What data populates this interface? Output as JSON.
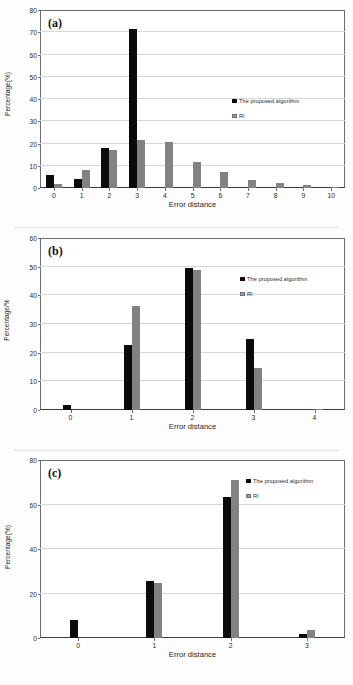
{
  "figure": {
    "panels": [
      "a",
      "b",
      "c"
    ]
  },
  "chart_data": [
    {
      "type": "bar",
      "panel_label": "(a)",
      "title": "",
      "xlabel": "Error distance",
      "ylabel": "Percentage(%)",
      "categories": [
        "0",
        "1",
        "2",
        "3",
        "4",
        "5",
        "6",
        "7",
        "8",
        "9",
        "10"
      ],
      "ylim": [
        0,
        80
      ],
      "yticks": [
        0,
        10,
        20,
        30,
        40,
        50,
        60,
        70,
        80
      ],
      "grid": true,
      "legend_position": "right-inside",
      "series": [
        {
          "name": "The proposed algorithm",
          "color": "#0b0b0b",
          "values": [
            6.0,
            4.0,
            18.0,
            71.6,
            0,
            0,
            0,
            0,
            0,
            0,
            0
          ]
        },
        {
          "name": "RI",
          "color": "#828282",
          "values": [
            1.8,
            8.0,
            16.9,
            21.7,
            20.8,
            11.5,
            7.4,
            3.6,
            2.3,
            1.3,
            0.5
          ]
        }
      ]
    },
    {
      "type": "bar",
      "panel_label": "(b)",
      "title": "",
      "xlabel": "Error distance",
      "ylabel": "Percentage/%",
      "categories": [
        "0",
        "1",
        "2",
        "3",
        "4"
      ],
      "ylim": [
        0,
        60
      ],
      "yticks": [
        0,
        10,
        20,
        30,
        40,
        50,
        60
      ],
      "grid": true,
      "legend_position": "right-inside",
      "series": [
        {
          "name": "The proposed algorithm",
          "color": "#0b0b0b",
          "values": [
            1.9,
            22.7,
            49.7,
            24.6,
            0
          ]
        },
        {
          "name": "RI",
          "color": "#828282",
          "values": [
            0,
            36.4,
            48.9,
            14.6,
            0.5
          ]
        }
      ]
    },
    {
      "type": "bar",
      "panel_label": "(c)",
      "title": "",
      "xlabel": "Error distance",
      "ylabel": "Percentage(%)",
      "categories": [
        "0",
        "1",
        "2",
        "3"
      ],
      "ylim": [
        0,
        80
      ],
      "yticks": [
        0,
        20,
        40,
        60,
        80
      ],
      "grid": true,
      "legend_position": "right-inside",
      "series": [
        {
          "name": "The proposed algorithm",
          "color": "#0b0b0b",
          "values": [
            7.9,
            25.7,
            63.5,
            1.7
          ]
        },
        {
          "name": "RI",
          "color": "#828282",
          "values": [
            0,
            24.9,
            70.8,
            3.4
          ]
        }
      ]
    }
  ]
}
